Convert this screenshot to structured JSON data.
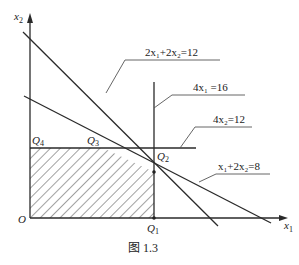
{
  "figure": {
    "caption": "图 1.3",
    "axes": {
      "x_label": "x",
      "x_sub": "1",
      "y_label": "x",
      "y_sub": "2",
      "origin_label": "O"
    },
    "constraints": [
      {
        "id": "c1",
        "label": "2x₁+2x₂=12"
      },
      {
        "id": "c2",
        "label": "4x₁ =16"
      },
      {
        "id": "c3",
        "label": "4x₂=12"
      },
      {
        "id": "c4",
        "label": "x₁+2x₂=8"
      }
    ],
    "points": [
      {
        "id": "Q1",
        "letter": "Q",
        "sub": "1"
      },
      {
        "id": "Q2",
        "letter": "Q",
        "sub": "2"
      },
      {
        "id": "Q3",
        "letter": "Q",
        "sub": "3"
      },
      {
        "id": "Q4",
        "letter": "Q",
        "sub": "4"
      }
    ],
    "colors": {
      "line": "#2a2a2a",
      "leader": "#555555",
      "hatch": "#444444"
    }
  }
}
